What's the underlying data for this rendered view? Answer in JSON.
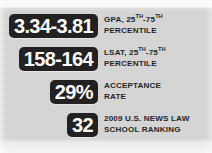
{
  "panel": {
    "background_color": "#d6d6d6",
    "badge_color": "#211f1f",
    "badge_text_color": "#ffffff",
    "label_text_color": "#242424"
  },
  "stats": [
    {
      "id": "gpa",
      "value": "3.34-3.81",
      "label_line1_pre": "GPA, 25",
      "label_line1_sup1": "TH",
      "label_line1_mid": "-75",
      "label_line1_sup2": "TH",
      "label_line2": "PERCENTILE"
    },
    {
      "id": "lsat",
      "value": "158-164",
      "label_line1_pre": "LSAT, 25",
      "label_line1_sup1": "TH",
      "label_line1_mid": "-75",
      "label_line1_sup2": "TH",
      "label_line2": "PERCENTILE"
    },
    {
      "id": "acceptance",
      "value": "29%",
      "label_line1_pre": "ACCEPTANCE",
      "label_line1_sup1": "",
      "label_line1_mid": "",
      "label_line1_sup2": "",
      "label_line2": "RATE"
    },
    {
      "id": "ranking",
      "value": "32",
      "label_line1_pre": "2009 U.S. NEWS LAW",
      "label_line1_sup1": "",
      "label_line1_mid": "",
      "label_line1_sup2": "",
      "label_line2": "SCHOOL RANKING"
    }
  ]
}
